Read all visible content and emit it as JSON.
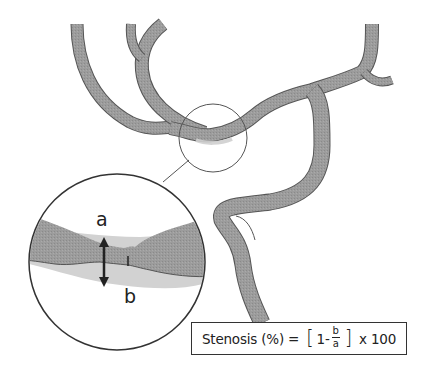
{
  "diagram": {
    "colors": {
      "vessel_fill": "#9a9a9a",
      "vessel_outline": "#555555",
      "lumen_original": "#cfcfcf",
      "circle_stroke": "#333333",
      "arrow": "#222222",
      "background": "#ffffff"
    },
    "labels": {
      "a": "a",
      "b": "b"
    },
    "formula": {
      "prefix": "Stenosis (%) = ",
      "open_bracket": "[",
      "one_minus": "1-",
      "frac_num": "b",
      "frac_den": "a",
      "close_bracket": "]",
      "suffix": " x 100"
    },
    "elements": {
      "small_circle": "Region of interest on vessel",
      "magnified_circle": "Magnified view of stenosis",
      "arrow_a": "Normal vessel diameter (a)",
      "marker_b": "Residual lumen diameter at stenosis (b)"
    }
  }
}
